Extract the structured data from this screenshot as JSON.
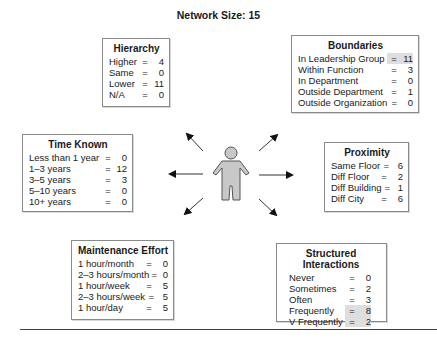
{
  "title": "Network Size: 15",
  "highlight_color": "#dedede",
  "figure_icon": "person-icon",
  "boxes": {
    "hierarchy": {
      "heading": "Hierarchy",
      "rows": [
        {
          "label": "Higher",
          "eq": "=",
          "value": "4"
        },
        {
          "label": "Same",
          "eq": "=",
          "value": "0"
        },
        {
          "label": "Lower",
          "eq": "=",
          "value": "11"
        },
        {
          "label": "N/A",
          "eq": "=",
          "value": "0"
        }
      ]
    },
    "boundaries": {
      "heading": "Boundaries",
      "rows": [
        {
          "label": "In Leadership Group",
          "eq": "=",
          "value": "11",
          "highlighted": true
        },
        {
          "label": "Within Function",
          "eq": "=",
          "value": "3"
        },
        {
          "label": "In Department",
          "eq": "=",
          "value": "0"
        },
        {
          "label": "Outside Department",
          "eq": "=",
          "value": "1"
        },
        {
          "label": "Outside Organization",
          "eq": "=",
          "value": "0"
        }
      ]
    },
    "time_known": {
      "heading": "Time Known",
      "rows": [
        {
          "label": "Less than 1 year",
          "eq": "=",
          "value": "0"
        },
        {
          "label": "1–3 years",
          "eq": "=",
          "value": "12"
        },
        {
          "label": "3–5 years",
          "eq": "=",
          "value": "3"
        },
        {
          "label": "5–10 years",
          "eq": "=",
          "value": "0"
        },
        {
          "label": "10+ years",
          "eq": "=",
          "value": "0"
        }
      ]
    },
    "proximity": {
      "heading": "Proximity",
      "rows": [
        {
          "label": "Same Floor",
          "eq": "=",
          "value": "6"
        },
        {
          "label": "Diff Floor",
          "eq": "=",
          "value": "2"
        },
        {
          "label": "Diff Building",
          "eq": "=",
          "value": "1"
        },
        {
          "label": "Diff City",
          "eq": "=",
          "value": "6"
        }
      ]
    },
    "maintenance": {
      "heading": "Maintenance Effort",
      "rows": [
        {
          "label": "1 hour/month",
          "eq": "=",
          "value": "0"
        },
        {
          "label": "2–3 hours/month",
          "eq": "=",
          "value": "0"
        },
        {
          "label": "1 hour/week",
          "eq": "=",
          "value": "5"
        },
        {
          "label": "2–3 hours/week",
          "eq": "=",
          "value": "5"
        },
        {
          "label": "1 hour/day",
          "eq": "=",
          "value": "5"
        }
      ]
    },
    "structured": {
      "heading": "Structured Interactions",
      "rows": [
        {
          "label": "Never",
          "eq": "=",
          "value": "0"
        },
        {
          "label": "Sometimes",
          "eq": "=",
          "value": "2"
        },
        {
          "label": "Often",
          "eq": "=",
          "value": "3"
        },
        {
          "label": "Frequently",
          "eq": "=",
          "value": "8",
          "highlighted": true
        },
        {
          "label": "V Frequently",
          "eq": "=",
          "value": "2",
          "highlighted": true
        }
      ]
    }
  }
}
